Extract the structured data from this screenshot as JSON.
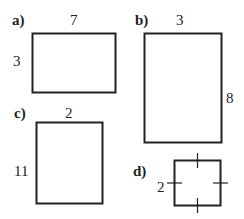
{
  "figures": [
    {
      "part": "a)",
      "shape": "rectangle",
      "top_label": "7",
      "side_label": "3"
    },
    {
      "part": "b)",
      "shape": "rectangle",
      "top_label": "3",
      "side_label": "8"
    },
    {
      "part": "c)",
      "shape": "rectangle",
      "top_label": "2",
      "side_label": "11"
    },
    {
      "part": "d)",
      "shape": "square",
      "side_label": "2",
      "tick_marks": 4
    }
  ],
  "colors": {
    "stroke": "#222222",
    "background": "#ffffff"
  }
}
